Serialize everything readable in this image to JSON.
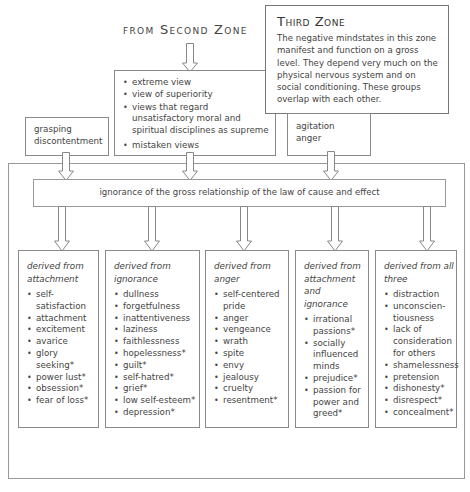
{
  "header": {
    "from_second_zone": "from Second Zone"
  },
  "third_zone": {
    "title": "Third Zone",
    "description": "The negative mindstates in this zone manifest and function on a gross level. They depend very much on the physical nervous system and on social conditioning. These groups overlap with each other."
  },
  "views_box": {
    "items": [
      "extreme view",
      "view of superiority",
      "views that regard unsatisfactory moral and spiritual disciplines as supreme",
      "mistaken views"
    ]
  },
  "left_input": {
    "lines": [
      "grasping",
      "discontentment"
    ]
  },
  "right_input": {
    "lines": [
      "agitation",
      "anger"
    ]
  },
  "central_bar": {
    "label": "ignorance of the gross relationship of the law of cause and effect"
  },
  "columns": [
    {
      "heading": "derived from attachment",
      "items": [
        "self-satisfaction",
        "attachment",
        "excitement",
        "avarice",
        "glory seeking*",
        "power lust*",
        "obsession*",
        "fear of loss*"
      ]
    },
    {
      "heading": "derived from ignorance",
      "items": [
        "dullness",
        "forgetfulness",
        "inattentiveness",
        "laziness",
        "faithlessness",
        "hopelessness*",
        "guilt*",
        "self-hatred*",
        "grief*",
        "low self-esteem*",
        "depression*"
      ]
    },
    {
      "heading": "derived from anger",
      "items": [
        "self-centered pride",
        "anger",
        "vengeance",
        "wrath",
        "spite",
        "envy",
        "jealousy",
        "cruelty",
        "resentment*"
      ]
    },
    {
      "heading": "derived from attachment and ignorance",
      "items": [
        "irrational passions*",
        "socially influenced minds",
        "prejudice*",
        "passion for power and greed*"
      ]
    },
    {
      "heading": "derived from all three",
      "items": [
        "distraction",
        "unconscien-tiousness",
        "lack of consideration for others",
        "shamelessness",
        "pretension",
        "dishonesty*",
        "disrespect*",
        "concealment*"
      ]
    }
  ],
  "colors": {
    "border": "#8a8a8a",
    "text": "#444444",
    "background": "#ffffff"
  }
}
